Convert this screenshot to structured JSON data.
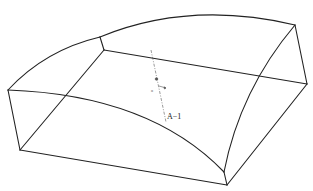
{
  "figure": {
    "caption_fragment": "",
    "labels": {
      "section": "A−1",
      "angle": "α"
    },
    "colors": {
      "line": "#222222",
      "axis": "#555555",
      "background": "#ffffff"
    }
  }
}
